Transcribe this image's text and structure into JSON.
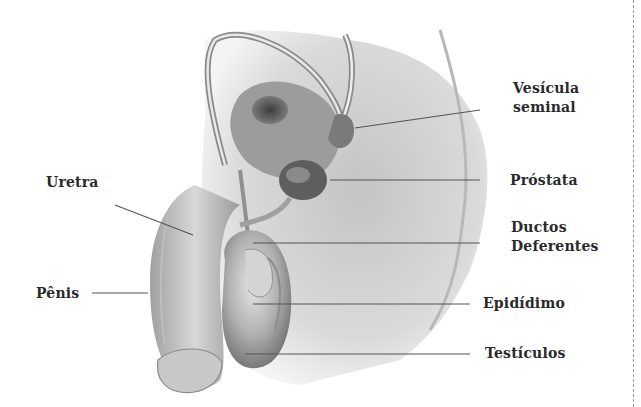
{
  "diagram": {
    "labels": {
      "vesicula_line1": "Vesícula",
      "vesicula_line2": "seminal",
      "prostata": "Próstata",
      "uretra": "Uretra",
      "ductos_line1": "Ductos",
      "ductos_line2": "Deferentes",
      "penis": "Pênis",
      "epididimo": "Epidídimo",
      "testiculos": "Testículos"
    },
    "colors": {
      "text": "#2a2a2a",
      "leader_line": "#555555",
      "tissue_light": "#d9d9d9",
      "tissue_mid": "#a8a8a8",
      "tissue_dark": "#5a5a5a",
      "border": "#9a9a9a"
    }
  }
}
